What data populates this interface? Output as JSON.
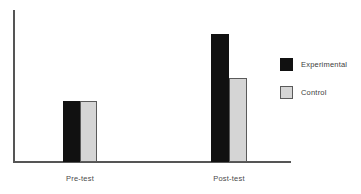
{
  "chart_data": {
    "type": "bar",
    "title": "",
    "subtitle": "",
    "xlabel": "",
    "ylabel": "",
    "categories": [
      "Pre-test",
      "Post-test"
    ],
    "series": [
      {
        "name": "Experimental",
        "values": [
          40,
          84
        ],
        "color": "#111111"
      },
      {
        "name": "Control",
        "values": [
          40,
          55
        ],
        "color": "#d5d5d5"
      }
    ],
    "ylim": [
      0,
      100
    ],
    "grid": false,
    "legend_position": "right",
    "annotations": []
  },
  "axes": {
    "y_axis_name": "value-axis",
    "x_axis_name": "category-axis",
    "axis_color": "#555555",
    "tick_labels_x": [
      "Pre-test",
      "Post-test"
    ],
    "tick_labels_y": []
  },
  "legend": {
    "items": [
      {
        "label": "Experimental",
        "swatch": "black-swatch"
      },
      {
        "label": "Control",
        "swatch": "gray-swatch"
      }
    ]
  },
  "colors": {
    "experimental": "#111111",
    "control": "#d5d5d5",
    "control_border": "#5a5a5a",
    "axis": "#555555",
    "text": "#4a4a4a",
    "background": "#ffffff"
  }
}
